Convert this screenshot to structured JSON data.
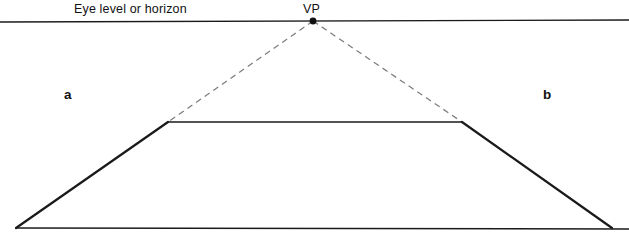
{
  "figure": {
    "width": 629,
    "height": 235,
    "background_color": "#ffffff",
    "line_color": "#1a1a1a",
    "dashed_line_color": "#7a7a7a",
    "labels": {
      "horizon": "Eye level or horizon",
      "vanishing_point": "VP",
      "left_region": "a",
      "right_region": "b"
    },
    "geometry": {
      "horizon_line": {
        "x1": 0,
        "y1": 22,
        "x2": 629,
        "y2": 20
      },
      "vanishing_point": {
        "x": 313,
        "y": 21
      },
      "trapezoid": {
        "bottom_left": {
          "x": 16,
          "y": 228
        },
        "top_left": {
          "x": 168,
          "y": 122
        },
        "top_right": {
          "x": 462,
          "y": 122
        },
        "bottom_right": {
          "x": 612,
          "y": 228
        }
      },
      "dashed_rays": [
        {
          "from": "vanishing_point",
          "to": "top_left"
        },
        {
          "from": "vanishing_point",
          "to": "top_right"
        }
      ]
    }
  }
}
